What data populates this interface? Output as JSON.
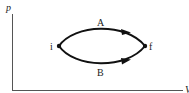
{
  "diagram": {
    "type": "pV-diagram",
    "axes": {
      "y_label": "p",
      "x_label": "V",
      "color": "#555555"
    },
    "points": [
      {
        "id": "i",
        "label": "i"
      },
      {
        "id": "f",
        "label": "f"
      }
    ],
    "paths": [
      {
        "id": "A",
        "label": "A",
        "from": "i",
        "to": "f",
        "position": "upper"
      },
      {
        "id": "B",
        "label": "B",
        "from": "i",
        "to": "f",
        "position": "lower"
      }
    ],
    "stroke_color": "#111111"
  }
}
